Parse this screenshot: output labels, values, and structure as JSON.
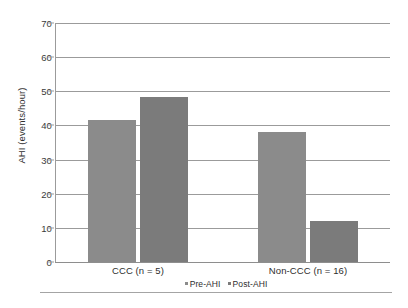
{
  "chart_data": {
    "type": "bar",
    "title": "",
    "subtitle": "",
    "xlabel": "",
    "ylabel": "AHI (events/hour)",
    "categories": [
      "CCC (n = 5)",
      "Non-CCC (n = 16)"
    ],
    "series": [
      {
        "name": "Pre-AHI",
        "values": [
          41.5,
          38.0
        ],
        "color": "#8b8b8b"
      },
      {
        "name": "Post-AHI",
        "values": [
          48.3,
          12.0
        ],
        "color": "#7b7b7b"
      }
    ],
    "ylim": [
      0,
      70
    ],
    "yticks": [
      0,
      10,
      20,
      30,
      40,
      50,
      60,
      70
    ],
    "ytick_labels": [
      "0",
      "10",
      "20",
      "30",
      "40",
      "50",
      "60",
      "70"
    ],
    "grid": true,
    "grid_axis": "y",
    "legend_position": "bottom-center",
    "legend": [
      "Pre-AHI",
      "Post-AHI"
    ],
    "annotations": []
  },
  "axes": {
    "y_title": "AHI (events/hour)",
    "y_tick_0": "0",
    "y_tick_10": "10",
    "y_tick_20": "20",
    "y_tick_30": "30",
    "y_tick_40": "40",
    "y_tick_50": "50",
    "y_tick_60": "60",
    "y_tick_70": "70"
  },
  "x_labels": {
    "group_1": "CCC (n = 5)",
    "group_2": "Non-CCC (n = 16)"
  },
  "legend": {
    "item_1": "Pre-AHI",
    "item_2": "Post-AHI"
  },
  "colors": {
    "pre_ahi": "#8b8b8b",
    "post_ahi": "#7b7b7b",
    "gridline": "#9b9b9b",
    "text": "#2e2e2e",
    "background": "#ffffff"
  }
}
